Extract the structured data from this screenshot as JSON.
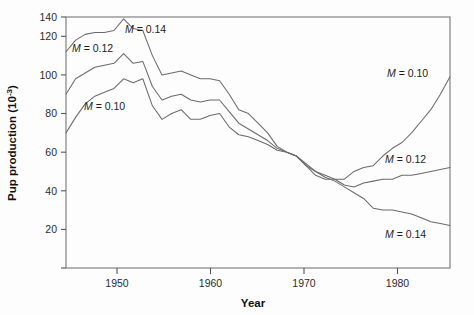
{
  "figure": {
    "background_color": "#fdfdfd",
    "line_color": "#6b6b6b",
    "axis_color": "#555555",
    "text_color": "#1c1c1c"
  },
  "axis": {
    "x_title": "Year",
    "y_title_main": "Pup production (10",
    "y_title_exp": "-3",
    "y_title_close": ")",
    "x_ticks": [
      "1950",
      "1960",
      "1970",
      "1980"
    ],
    "y_ticks": [
      "20",
      "40",
      "60",
      "80",
      "100",
      "120",
      "140"
    ]
  },
  "annotations": {
    "m014_top": {
      "m": "M",
      "eq": " = 0.14"
    },
    "m012_top": {
      "m": "M",
      "eq": " = 0.12"
    },
    "m010_top": {
      "m": "M",
      "eq": " = 0.10"
    },
    "m010_right": {
      "m": "M",
      "eq": " = 0.10"
    },
    "m012_right": {
      "m": "M",
      "eq": " = 0.12"
    },
    "m014_right": {
      "m": "M",
      "eq": " = 0.14"
    }
  },
  "chart_data": {
    "type": "line",
    "title": "",
    "xlabel": "Year",
    "ylabel": "Pup production (10^-3)",
    "xlim": [
      1945,
      1985
    ],
    "ylim": [
      10,
      140
    ],
    "grid": false,
    "legend": "inline-annotations",
    "x": [
      1945,
      1946,
      1947,
      1948,
      1949,
      1950,
      1951,
      1952,
      1953,
      1954,
      1955,
      1956,
      1957,
      1958,
      1959,
      1960,
      1961,
      1962,
      1963,
      1964,
      1965,
      1966,
      1967,
      1968,
      1969,
      1970,
      1971,
      1972,
      1973,
      1974,
      1975,
      1976,
      1977,
      1978,
      1979,
      1980,
      1981,
      1982,
      1983,
      1984,
      1985
    ],
    "series": [
      {
        "name": "M = 0.14",
        "label": "M = 0.14",
        "values": [
          122,
          128,
          131,
          132,
          132,
          133,
          139,
          134,
          133,
          120,
          110,
          111,
          112,
          110,
          108,
          108,
          107,
          100,
          92,
          90,
          85,
          80,
          73,
          70,
          68,
          63,
          60,
          57,
          55,
          52,
          49,
          46,
          41,
          40,
          40,
          39,
          38,
          36,
          34,
          33,
          32
        ]
      },
      {
        "name": "M = 0.12",
        "label": "M = 0.12",
        "values": [
          100,
          108,
          111,
          114,
          115,
          116,
          121,
          116,
          117,
          104,
          97,
          99,
          100,
          97,
          96,
          97,
          97,
          91,
          85,
          82,
          79,
          76,
          72,
          70,
          68,
          64,
          60,
          58,
          56,
          53,
          52,
          54,
          55,
          56,
          56,
          58,
          58,
          59,
          60,
          61,
          62
        ]
      },
      {
        "name": "M = 0.10",
        "label": "M = 0.10",
        "values": [
          80,
          88,
          95,
          99,
          101,
          103,
          108,
          106,
          108,
          94,
          87,
          90,
          92,
          87,
          87,
          89,
          90,
          83,
          79,
          78,
          76,
          74,
          71,
          70,
          68,
          63,
          58,
          56,
          56,
          56,
          60,
          62,
          63,
          68,
          72,
          75,
          80,
          86,
          92,
          100,
          109
        ]
      }
    ]
  }
}
